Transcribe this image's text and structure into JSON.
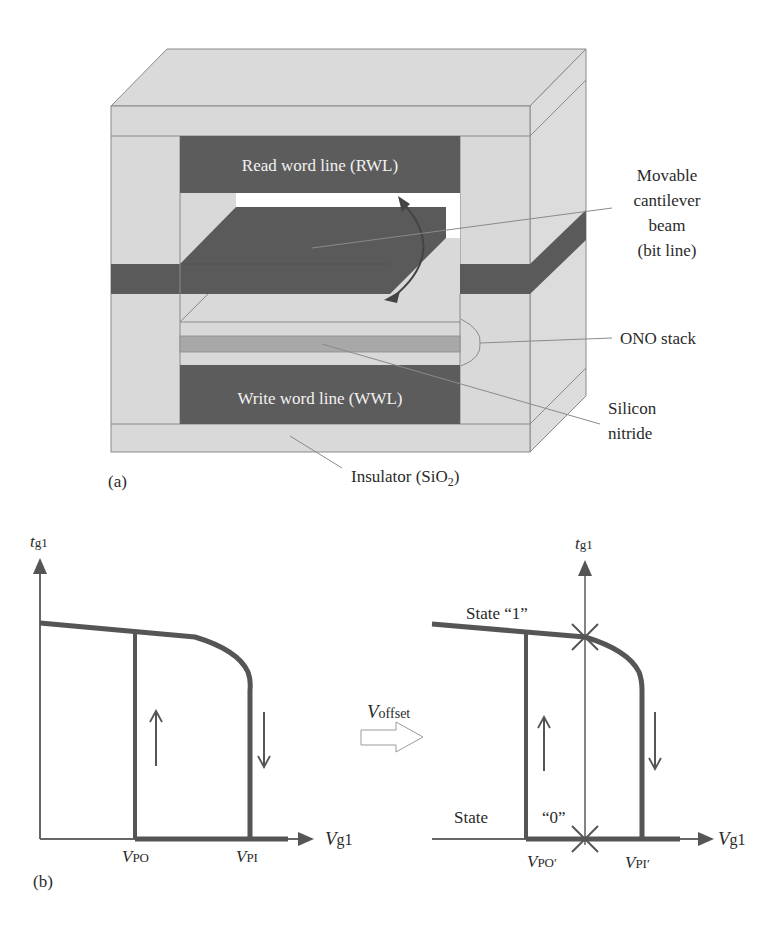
{
  "colors": {
    "light_gray": "#d9d9d9",
    "dark_gray": "#5a5a5a",
    "mid_gray": "#a9a9a9",
    "edge": "#8a8a8a",
    "curve": "#555555",
    "text": "#2a2a2a",
    "white_text": "#f0f0f0"
  },
  "panel_a": {
    "tag": "(a)",
    "rwl_label": "Read word line (RWL)",
    "wwl_label": "Write word line (WWL)",
    "callouts": {
      "beam": [
        "Movable",
        "cantilever",
        "beam",
        "(bit line)"
      ],
      "ono": "ONO stack",
      "nitride": [
        "Silicon",
        "nitride"
      ],
      "insulator_prefix": "Insulator (SiO",
      "insulator_sub": "2",
      "insulator_suffix": ")"
    }
  },
  "panel_b": {
    "tag": "(b)",
    "left_graph": {
      "y_axis": {
        "var": "t",
        "sub": "g1"
      },
      "x_axis": {
        "var": "V",
        "sub": "g1"
      },
      "tick_labels": [
        {
          "var": "V",
          "sub": "PO"
        },
        {
          "var": "V",
          "sub": "PI"
        }
      ]
    },
    "transform_arrow": {
      "var": "V",
      "sub": "offset"
    },
    "right_graph": {
      "y_axis": {
        "var": "t",
        "sub": "g1"
      },
      "x_axis": {
        "var": "V",
        "sub": "g1"
      },
      "state1_label": "State “1”",
      "state0_label_a": "State",
      "state0_label_b": "“0”",
      "tick_labels": [
        {
          "var": "V",
          "sub": "PO′"
        },
        {
          "var": "V",
          "sub": "PI′"
        }
      ]
    }
  }
}
